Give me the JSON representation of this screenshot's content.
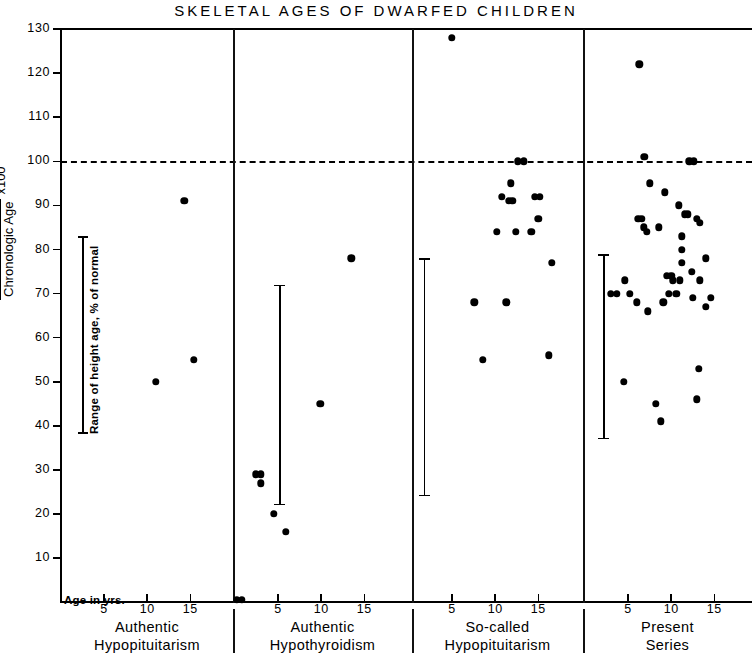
{
  "chart_data": {
    "type": "scatter",
    "title": "SKELETAL  AGES  OF  DWARFED  CHILDREN",
    "xlabel": "Age in yrs.",
    "ylabel_numerator": "Skeletal Age",
    "ylabel_denominator": "Chronologic Age",
    "ylabel_multiplier": "x100",
    "ylim": [
      0,
      130
    ],
    "yticks": [
      130,
      120,
      110,
      100,
      90,
      80,
      70,
      60,
      50,
      40,
      30,
      20,
      10
    ],
    "xlim": [
      0,
      18
    ],
    "xticks": [
      5,
      10,
      15
    ],
    "grid": false,
    "legend": "none",
    "reference_line": {
      "value": 100,
      "style": "dashed",
      "label": "100% of normal"
    },
    "range_legend": {
      "text": "Range of height age, % of normal",
      "from": 43,
      "to": 88
    },
    "panels": [
      {
        "name": "Authentic Hypopituitarism",
        "caption_line1": "Authentic",
        "caption_line2": "Hypopituitarism",
        "points": [
          {
            "x": 11.0,
            "y": 50
          },
          {
            "x": 14.3,
            "y": 91
          },
          {
            "x": 15.4,
            "y": 55
          }
        ],
        "range_bar": null
      },
      {
        "name": "Authentic Hypothyroidism",
        "caption_line1": "Authentic",
        "caption_line2": "Hypothyroidism",
        "points": [
          {
            "x": 0.2,
            "y": 0.5
          },
          {
            "x": 0.8,
            "y": 0.5
          },
          {
            "x": 2.4,
            "y": 29
          },
          {
            "x": 3.0,
            "y": 29
          },
          {
            "x": 3.0,
            "y": 27
          },
          {
            "x": 4.5,
            "y": 20
          },
          {
            "x": 5.9,
            "y": 16
          },
          {
            "x": 9.9,
            "y": 45
          },
          {
            "x": 13.5,
            "y": 78
          }
        ],
        "range_bar": {
          "x": 5.2,
          "low": 22,
          "high": 72
        }
      },
      {
        "name": "So-called Hypopituitarism",
        "caption_line1": "So-called",
        "caption_line2": "Hypopituitarism",
        "points": [
          {
            "x": 5.0,
            "y": 128
          },
          {
            "x": 12.6,
            "y": 100
          },
          {
            "x": 13.3,
            "y": 100
          },
          {
            "x": 11.8,
            "y": 95
          },
          {
            "x": 10.8,
            "y": 92
          },
          {
            "x": 11.6,
            "y": 91
          },
          {
            "x": 12.0,
            "y": 91
          },
          {
            "x": 14.6,
            "y": 92
          },
          {
            "x": 15.2,
            "y": 92
          },
          {
            "x": 15.0,
            "y": 87
          },
          {
            "x": 10.2,
            "y": 84
          },
          {
            "x": 12.4,
            "y": 84
          },
          {
            "x": 14.2,
            "y": 84
          },
          {
            "x": 16.6,
            "y": 77
          },
          {
            "x": 7.6,
            "y": 68
          },
          {
            "x": 11.3,
            "y": 68
          },
          {
            "x": 8.6,
            "y": 55
          },
          {
            "x": 16.2,
            "y": 56
          }
        ],
        "range_bar": {
          "x": 1.8,
          "low": 24,
          "high": 78
        }
      },
      {
        "name": "Present Series",
        "caption_line1": "Present",
        "caption_line2": "Series",
        "points": [
          {
            "x": 6.3,
            "y": 122
          },
          {
            "x": 6.9,
            "y": 101
          },
          {
            "x": 12.1,
            "y": 100
          },
          {
            "x": 12.6,
            "y": 100
          },
          {
            "x": 7.5,
            "y": 95
          },
          {
            "x": 9.3,
            "y": 93
          },
          {
            "x": 10.9,
            "y": 90
          },
          {
            "x": 6.2,
            "y": 87
          },
          {
            "x": 6.6,
            "y": 87
          },
          {
            "x": 11.6,
            "y": 88
          },
          {
            "x": 11.9,
            "y": 88
          },
          {
            "x": 13.0,
            "y": 87
          },
          {
            "x": 13.3,
            "y": 86
          },
          {
            "x": 6.8,
            "y": 85
          },
          {
            "x": 7.2,
            "y": 84
          },
          {
            "x": 8.6,
            "y": 85
          },
          {
            "x": 11.2,
            "y": 83
          },
          {
            "x": 11.2,
            "y": 80
          },
          {
            "x": 11.2,
            "y": 77
          },
          {
            "x": 14.0,
            "y": 78
          },
          {
            "x": 12.4,
            "y": 75
          },
          {
            "x": 9.5,
            "y": 74
          },
          {
            "x": 10.0,
            "y": 74
          },
          {
            "x": 10.2,
            "y": 73
          },
          {
            "x": 11.0,
            "y": 73
          },
          {
            "x": 13.3,
            "y": 73
          },
          {
            "x": 4.6,
            "y": 73
          },
          {
            "x": 9.7,
            "y": 70
          },
          {
            "x": 10.6,
            "y": 70
          },
          {
            "x": 5.2,
            "y": 70
          },
          {
            "x": 3.0,
            "y": 70
          },
          {
            "x": 3.7,
            "y": 70
          },
          {
            "x": 12.5,
            "y": 69
          },
          {
            "x": 6.0,
            "y": 68
          },
          {
            "x": 9.1,
            "y": 68
          },
          {
            "x": 14.6,
            "y": 69
          },
          {
            "x": 14.0,
            "y": 67
          },
          {
            "x": 7.3,
            "y": 66
          },
          {
            "x": 13.2,
            "y": 53
          },
          {
            "x": 4.5,
            "y": 50
          },
          {
            "x": 8.2,
            "y": 45
          },
          {
            "x": 13.0,
            "y": 46
          },
          {
            "x": 8.8,
            "y": 41
          }
        ],
        "range_bar": {
          "x": 2.2,
          "low": 37,
          "high": 79
        }
      }
    ]
  }
}
